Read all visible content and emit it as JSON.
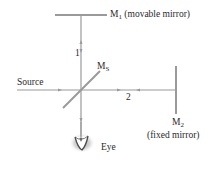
{
  "diagram": {
    "colors": {
      "line": "#9a9a9a",
      "text": "#2a2a2a",
      "eye_shadow": "#8a8a8a"
    },
    "labels": {
      "m1_main": "M",
      "m1_sub": "1",
      "m1_desc": " (movable mirror)",
      "ms_main": "M",
      "ms_sub": "S",
      "m2_main": "M",
      "m2_sub": "2",
      "m2_desc": "(fixed mirror)",
      "source": "Source",
      "path1": "1",
      "path2": "2",
      "eye": "Eye"
    },
    "components": [
      {
        "id": "M1",
        "type": "mirror",
        "description": "movable mirror",
        "orientation": "horizontal"
      },
      {
        "id": "MS",
        "type": "beam-splitter",
        "orientation": "diagonal 45°"
      },
      {
        "id": "M2",
        "type": "mirror",
        "description": "fixed mirror",
        "orientation": "vertical"
      },
      {
        "id": "Source",
        "type": "light source"
      },
      {
        "id": "Eye",
        "type": "observer"
      }
    ],
    "beam_paths": [
      {
        "label": "1",
        "from": "MS",
        "to": "M1",
        "direction": "vertical"
      },
      {
        "label": "2",
        "from": "MS",
        "to": "M2",
        "direction": "horizontal"
      }
    ]
  }
}
